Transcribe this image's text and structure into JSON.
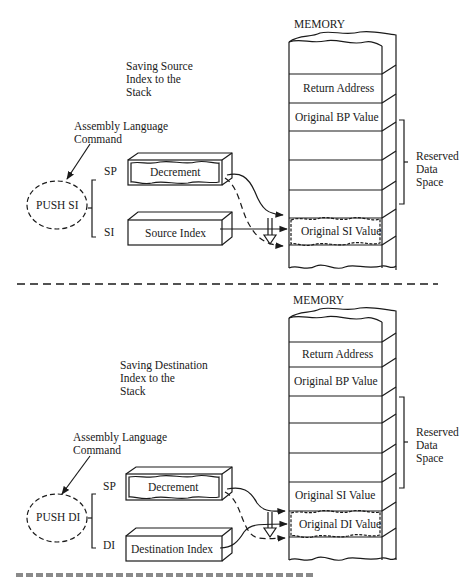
{
  "panels": [
    {
      "id": "push-si",
      "title": "Saving Source\nIndex to the\nStack",
      "annotation": "Assembly Language\nCommand",
      "command": "PUSH SI",
      "registers": [
        {
          "name": "SP",
          "box_label": "Decrement",
          "highlighted": true
        },
        {
          "name": "SI",
          "box_label": "Source Index",
          "highlighted": false
        }
      ],
      "memory": {
        "title": "MEMORY",
        "cells": [
          "",
          "Return Address",
          "Original BP Value",
          "",
          "",
          "",
          "Original SI Value",
          ""
        ],
        "highlighted_cell": "Original SI Value",
        "bracket_label": "Reserved\nData\nSpace"
      }
    },
    {
      "id": "push-di",
      "title": "Saving Destination\nIndex to the\nStack",
      "annotation": "Assembly Language\nCommand",
      "command": "PUSH DI",
      "registers": [
        {
          "name": "SP",
          "box_label": "Decrement",
          "highlighted": true
        },
        {
          "name": "DI",
          "box_label": "Destination Index",
          "highlighted": false
        }
      ],
      "memory": {
        "title": "MEMORY",
        "cells": [
          "",
          "Return Address",
          "Original BP Value",
          "",
          "",
          "Original SI Value",
          "Original DI Value",
          ""
        ],
        "highlighted_cell": "Original DI Value",
        "bracket_label": "Reserved\nData\nSpace"
      }
    }
  ],
  "colors": {
    "ink": "#1a1a1a",
    "background": "#ffffff"
  }
}
